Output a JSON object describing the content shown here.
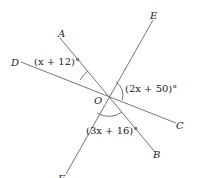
{
  "diagram": {
    "center": {
      "name": "O",
      "x": 108,
      "y": 95
    },
    "lines": [
      {
        "from": "A",
        "to": "B",
        "x1": 60,
        "y1": 38,
        "x2": 155,
        "y2": 152
      },
      {
        "from": "D",
        "to": "C",
        "x1": 21,
        "y1": 62,
        "x2": 176,
        "y2": 123
      },
      {
        "from": "E",
        "to": "F",
        "x1": 153,
        "y1": 20,
        "x2": 66,
        "y2": 174
      }
    ],
    "points": {
      "A": "A",
      "B": "B",
      "C": "C",
      "D": "D",
      "E": "E",
      "F": "F",
      "O": "O"
    },
    "angles": {
      "AOD": "(x + 12)°",
      "EOC": "(2x + 50)°",
      "FOB": "(3x + 16)°"
    },
    "line_color": "#555555"
  }
}
